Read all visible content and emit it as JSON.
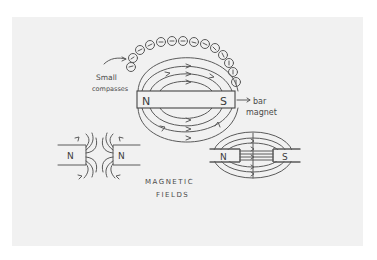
{
  "title": "MAGNETIC FIELDS",
  "title_lines": [
    "MAGNETIC",
    "FIELDS"
  ],
  "labels": {
    "small_compasses_line1": "Small",
    "small_compasses_line2": "compasses",
    "bar_magnet_line1": "bar",
    "bar_magnet_line2": "magnet"
  },
  "diagrams": {
    "bar_magnet": {
      "north": "N",
      "south": "S"
    },
    "repelling": {
      "left": "N",
      "right": "N"
    },
    "attracting": {
      "left": "N",
      "right": "S"
    }
  },
  "colors": {
    "paper": "#f1f1f1",
    "background": "#ffffff",
    "ink": "#5a5a5a"
  }
}
